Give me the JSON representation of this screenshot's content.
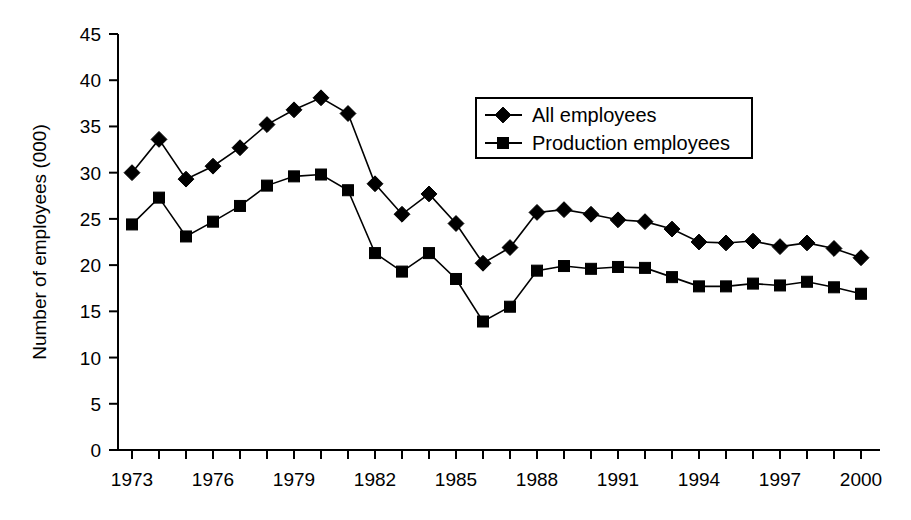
{
  "chart_data": {
    "type": "line",
    "title": "",
    "subtitle": "",
    "xlabel": "",
    "ylabel": "Number of employees (000)",
    "xlim": [
      1973,
      2000
    ],
    "ylim": [
      0,
      45
    ],
    "ytick_step": 5,
    "yticks": [
      0,
      5,
      10,
      15,
      20,
      25,
      30,
      35,
      40,
      45
    ],
    "ytick_labels": [
      "0",
      "5",
      "10",
      "15",
      "20",
      "25",
      "30",
      "35",
      "40",
      "45"
    ],
    "x": [
      1973,
      1974,
      1975,
      1976,
      1977,
      1978,
      1979,
      1980,
      1981,
      1982,
      1983,
      1984,
      1985,
      1986,
      1987,
      1988,
      1989,
      1990,
      1991,
      1992,
      1993,
      1994,
      1995,
      1996,
      1997,
      1998,
      1999,
      2000
    ],
    "xtick_labels": [
      "1973",
      "1976",
      "1979",
      "1982",
      "1985",
      "1988",
      "1991",
      "1994",
      "1997",
      "2000"
    ],
    "xtick_values": [
      1973,
      1976,
      1979,
      1982,
      1985,
      1988,
      1991,
      1994,
      1997,
      2000
    ],
    "grid": false,
    "legend_position": "top-right",
    "series": [
      {
        "name": "All employees",
        "marker": "diamond",
        "color": "#000000",
        "values": [
          30.0,
          33.6,
          29.3,
          30.7,
          32.7,
          35.2,
          36.8,
          38.1,
          36.4,
          28.8,
          25.5,
          27.7,
          24.5,
          20.2,
          21.9,
          25.7,
          26.0,
          25.5,
          24.9,
          24.7,
          23.9,
          22.5,
          22.4,
          22.6,
          22.0,
          22.4,
          21.8,
          20.8
        ]
      },
      {
        "name": "Production employees",
        "marker": "square",
        "color": "#000000",
        "values": [
          24.4,
          27.3,
          23.1,
          24.7,
          26.4,
          28.6,
          29.6,
          29.8,
          28.1,
          21.3,
          19.3,
          21.3,
          18.5,
          13.9,
          15.5,
          19.4,
          19.9,
          19.6,
          19.8,
          19.7,
          18.7,
          17.7,
          17.7,
          18.0,
          17.8,
          18.2,
          17.6,
          16.9
        ]
      }
    ]
  },
  "legend": {
    "items": [
      {
        "label": "All employees",
        "marker": "diamond"
      },
      {
        "label": "Production employees",
        "marker": "square"
      }
    ]
  }
}
